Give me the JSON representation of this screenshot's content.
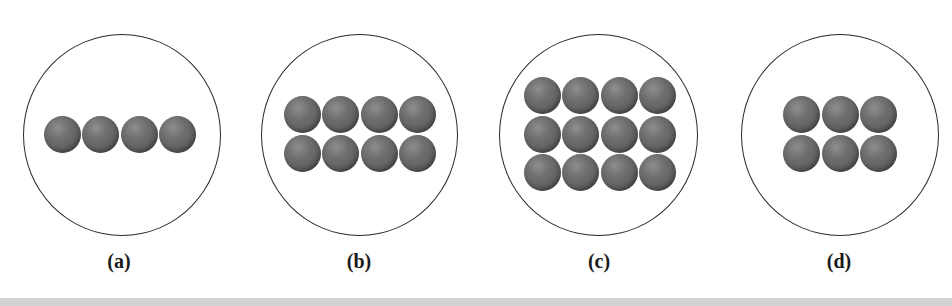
{
  "figure": {
    "panels": [
      {
        "label": "(a)",
        "rows": 1,
        "cols": 4,
        "count": 4
      },
      {
        "label": "(b)",
        "rows": 2,
        "cols": 4,
        "count": 8
      },
      {
        "label": "(c)",
        "rows": 3,
        "cols": 4,
        "count": 12
      },
      {
        "label": "(d)",
        "rows": 2,
        "cols": 3,
        "count": 6
      }
    ],
    "colors": {
      "ball": "#626262",
      "circle_stroke": "#2a2a2a",
      "background": "#ffffff",
      "divider": "#d3d3d3"
    }
  }
}
